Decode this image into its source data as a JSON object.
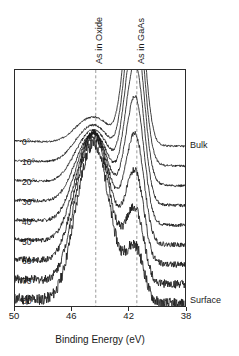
{
  "chart_data": {
    "type": "line",
    "title": "",
    "subtitle": "",
    "xlabel": "Binding Energy (eV)",
    "ylabel": "",
    "xlim": [
      50,
      38
    ],
    "ylim": [
      0,
      1
    ],
    "x_ticks": [
      50,
      46,
      42,
      38
    ],
    "x_tick_labels": [
      "50",
      "46",
      "42",
      "38"
    ],
    "x_axis_reversed": true,
    "grid": false,
    "legend_position": "none",
    "series_label_left_title": "Emission angle",
    "annotations": [
      {
        "name": "oxide-guide",
        "text": "As in Oxide",
        "x": 44.3,
        "orientation": "vertical",
        "style": "dashed-line"
      },
      {
        "name": "gaas-guide",
        "text": "As in GaAs",
        "x": 41.4,
        "orientation": "vertical",
        "style": "dashed-line"
      },
      {
        "name": "bulk",
        "text": "Bulk",
        "position": "right-top"
      },
      {
        "name": "surface",
        "text": "Surface",
        "position": "right-bottom"
      }
    ],
    "series": [
      {
        "name": "0°",
        "oxide_amplitude": 0.16,
        "gaas_amplitude": 1.0,
        "noise": 0.012
      },
      {
        "name": "10°",
        "oxide_amplitude": 0.23,
        "gaas_amplitude": 0.93,
        "noise": 0.014
      },
      {
        "name": "20°",
        "oxide_amplitude": 0.32,
        "gaas_amplitude": 0.86,
        "noise": 0.016
      },
      {
        "name": "30°",
        "oxide_amplitude": 0.42,
        "gaas_amplitude": 0.78,
        "noise": 0.019
      },
      {
        "name": "40°",
        "oxide_amplitude": 0.54,
        "gaas_amplitude": 0.7,
        "noise": 0.023
      },
      {
        "name": "50°",
        "oxide_amplitude": 0.66,
        "gaas_amplitude": 0.6,
        "noise": 0.03
      },
      {
        "name": "60°",
        "oxide_amplitude": 0.78,
        "gaas_amplitude": 0.5,
        "noise": 0.04
      },
      {
        "name": "70°",
        "oxide_amplitude": 0.88,
        "gaas_amplitude": 0.4,
        "noise": 0.055
      },
      {
        "name": "80°",
        "oxide_amplitude": 0.95,
        "gaas_amplitude": 0.3,
        "noise": 0.075
      }
    ],
    "peak_centers": {
      "oxide": 44.3,
      "gaas": 41.4
    },
    "peak_widths": {
      "oxide": 1.05,
      "gaas": 0.55
    },
    "stack_offset_note": "curves vertically offset, bulk at top, surface at bottom"
  },
  "axis": {
    "xlabel": "Binding Energy (eV)",
    "ticks": [
      "50",
      "46",
      "42",
      "38"
    ]
  },
  "guides": {
    "oxide_label": "As in Oxide",
    "gaas_label": "As in GaAs"
  },
  "side": {
    "bulk": "Bulk",
    "surface": "Surface"
  },
  "angles": [
    "0°",
    "10°",
    "20°",
    "30°",
    "40°",
    "50°",
    "60°",
    "70°",
    "80°"
  ],
  "colors": {
    "curve": "#1a1a1a",
    "frame": "#2b2b2b",
    "guide": "#9a9a9a",
    "background": "#ffffff"
  }
}
